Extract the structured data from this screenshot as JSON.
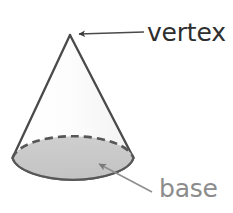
{
  "figure": {
    "background_color": "#ffffff",
    "width": 233,
    "height": 213
  },
  "shape": {
    "name": "cone",
    "body_fill": "#fbfbfb",
    "body_stroke": "#4a4a4a",
    "base_fill": "#c6c6c6",
    "base_stroke": "#575757",
    "hidden_edge_style": "dashed",
    "apex": {
      "x": 70,
      "y": 35
    },
    "base_ellipse": {
      "cx": 73,
      "cy": 162,
      "rx": 61,
      "ry": 25
    }
  },
  "annotations": [
    {
      "id": "vertex",
      "label": "vertex",
      "color": "#2e2e2e",
      "arrow_color": "#4a4a4a",
      "points_to": "apex",
      "arrow_from": {
        "x": 144,
        "y": 32
      },
      "arrow_to": {
        "x": 75,
        "y": 34
      }
    },
    {
      "id": "base",
      "label": "base",
      "color": "#8c8c8c",
      "arrow_color": "#8f8f8f",
      "points_to": "base-face",
      "arrow_from": {
        "x": 152,
        "y": 192
      },
      "arrow_to": {
        "x": 95,
        "y": 162
      }
    }
  ]
}
